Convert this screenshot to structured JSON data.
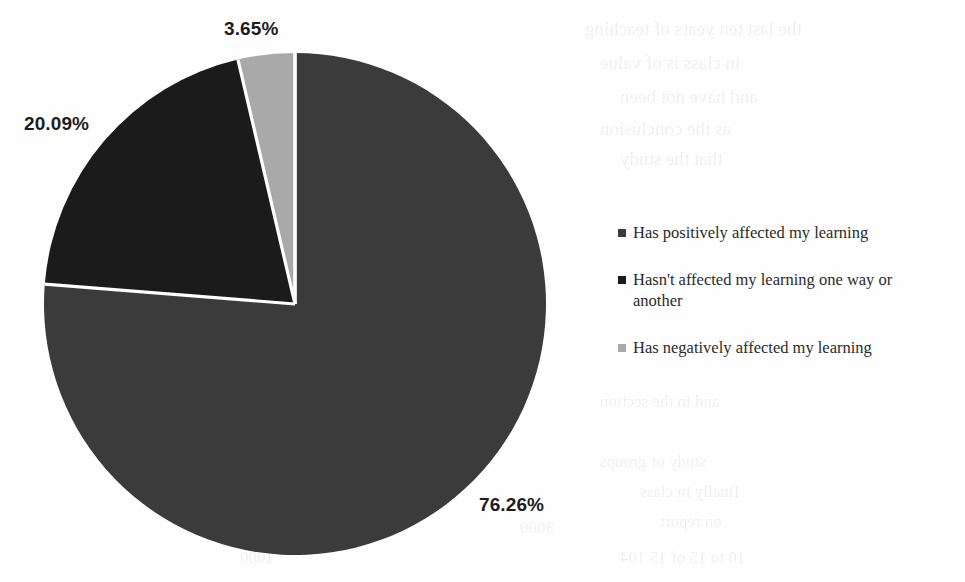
{
  "chart_data": {
    "type": "pie",
    "title": "",
    "categories": [
      "Has positively affected my learning",
      "Hasn't affected my learning one way or another",
      "Has negatively affected my learning"
    ],
    "values": [
      76.26,
      20.09,
      3.65
    ],
    "value_labels": [
      "76.26%",
      "20.09%",
      "3.65%"
    ],
    "unit": "%",
    "start_angle_deg": 0,
    "direction": "clockwise",
    "legend_position": "right",
    "grid": false,
    "slice_colors": [
      "#3b3b3b",
      "#1b1b1b",
      "#a9a9a9"
    ],
    "separator_color": "#ffffff"
  },
  "labels": {
    "positive_pct": "76.26%",
    "neutral_pct": "20.09%",
    "negative_pct": "3.65%"
  },
  "legend": {
    "items": [
      {
        "label": "Has positively affected my learning",
        "color": "#3b3b3b"
      },
      {
        "label": "Hasn't affected my learning one way or another",
        "color": "#1b1b1b"
      },
      {
        "label": "Has negatively affected my learning",
        "color": "#a9a9a9"
      }
    ]
  },
  "background_artifacts": {
    "description": "faint illegible scanned-page bleed-through text",
    "lines": [
      {
        "text": "the last ten years  of  teaching",
        "x": 585,
        "y": 18,
        "size": 19
      },
      {
        "text": "in class  is  of  value",
        "x": 600,
        "y": 52,
        "size": 19
      },
      {
        "text": "and  have  not  been",
        "x": 620,
        "y": 86,
        "size": 19
      },
      {
        "text": "as the  conclusion",
        "x": 600,
        "y": 118,
        "size": 19
      },
      {
        "text": "that the  study",
        "x": 620,
        "y": 148,
        "size": 19
      },
      {
        "text": "and  in  the  section",
        "x": 600,
        "y": 392,
        "size": 17
      },
      {
        "text": "study  or  groups",
        "x": 600,
        "y": 452,
        "size": 17
      },
      {
        "text": "finally  in  class",
        "x": 640,
        "y": 482,
        "size": 17
      },
      {
        "text": "on  report",
        "x": 660,
        "y": 512,
        "size": 17
      },
      {
        "text": "10  to  15  of  15  104",
        "x": 620,
        "y": 548,
        "size": 17
      },
      {
        "text": "3000",
        "x": 520,
        "y": 518,
        "size": 17
      },
      {
        "text": "1000",
        "x": 240,
        "y": 548,
        "size": 17
      }
    ]
  }
}
